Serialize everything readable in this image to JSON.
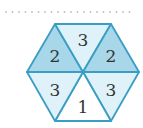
{
  "diagram": {
    "shape": "hexagon divided into 6 equilateral triangles",
    "colors": {
      "stroke": "#3a9ec4",
      "dark_fill": "#a9d7ea",
      "light_fill": "#dff1f9",
      "white_fill": "#ffffff",
      "text": "#333333",
      "dots": "#b8c0c6"
    },
    "triangles": [
      {
        "position": "top-left",
        "label": "2",
        "fill": "dark"
      },
      {
        "position": "top",
        "label": "3",
        "fill": "light"
      },
      {
        "position": "top-right",
        "label": "2",
        "fill": "dark"
      },
      {
        "position": "bottom-right",
        "label": "3",
        "fill": "light"
      },
      {
        "position": "bottom",
        "label": "1",
        "fill": "white"
      },
      {
        "position": "bottom-left",
        "label": "3",
        "fill": "light"
      }
    ]
  }
}
